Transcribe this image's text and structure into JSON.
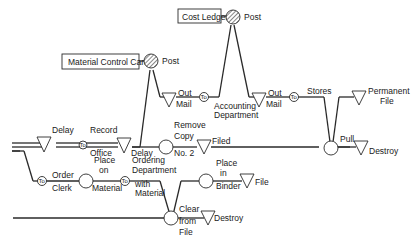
{
  "diagram": {
    "type": "flow-process-chart",
    "boxes": {
      "material_control_card": "Material Control Card",
      "cost_ledger": "Cost Ledger"
    },
    "labels": {
      "post_1": "Post",
      "post_2": "Post",
      "out_1": "Out",
      "mail_1": "Mail",
      "to_symbol": "To",
      "accounting_1": "Accounting",
      "accounting_2": "Department",
      "out_2": "Out",
      "mail_2": "Mail",
      "stores": "Stores",
      "permanent_1": "Permanent",
      "permanent_2": "File",
      "delay_1": "Delay",
      "record_1": "Record",
      "record_2": "Office",
      "delay_2": "Delay",
      "remove_1": "Remove",
      "remove_2": "Copy",
      "remove_3": "No. 2",
      "filed": "Filed",
      "pull": "Pull",
      "destroy_1": "Destroy",
      "order_1": "Order",
      "order_2": "Clerk",
      "place_1": "Place",
      "place_2": "on",
      "place_3": "Material",
      "ordering_1": "Ordering",
      "ordering_2": "Department",
      "ordering_3": "with",
      "ordering_4": "Material",
      "binder_1": "Place",
      "binder_2": "in",
      "binder_3": "Binder",
      "file": "File",
      "clear_1": "Clear",
      "clear_2": "from",
      "clear_3": "File",
      "destroy_2": "Destroy"
    },
    "symbols": {
      "operation": "circle",
      "post_operation": "hatched-circle",
      "storage_delay": "inverted-triangle",
      "transport": "circle-To"
    }
  }
}
